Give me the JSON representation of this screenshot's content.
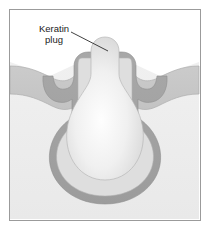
{
  "figure": {
    "frame": {
      "border_color": "#9b9b9b",
      "background_color": "#ffffff"
    },
    "labels": [
      {
        "name": "keratin-plug-label",
        "line1": "Keratin",
        "line2": "plug",
        "leader_line": true
      }
    ],
    "regions": [
      {
        "name": "epidermis",
        "color": "#c9c9c9"
      },
      {
        "name": "dermis",
        "color": "#eeeeee"
      },
      {
        "name": "follicle-wall",
        "color": "#a3a3a3"
      },
      {
        "name": "follicle-lumen",
        "color": "#dcdcdc"
      },
      {
        "name": "keratin-plug",
        "color": "#f2f2f2"
      }
    ],
    "colors": {
      "outline": "#8c8c8c",
      "epidermis": "#c9c9c9",
      "dermis": "#eeeeee",
      "follicle_wall": "#a3a3a3",
      "lumen": "#dcdcdc",
      "plug_core": "#fdfdfd",
      "plug_edge": "#d6d6d6",
      "label": "#1a1a1a",
      "leader": "#2b2b2b"
    }
  }
}
